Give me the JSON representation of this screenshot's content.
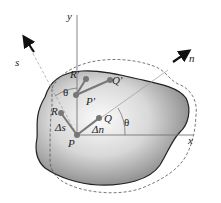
{
  "figure": {
    "type": "mechanics-deformation-diagram",
    "colors": {
      "body_fill_light": "#f2f2f2",
      "body_fill_dark": "#6e6e6e",
      "outline": "#222222",
      "dashed_outline": "#555555",
      "axis": "#777777",
      "points": "#777777"
    }
  },
  "axes": {
    "x_label": "x",
    "y_label": "y",
    "n_label": "n",
    "s_label": "s"
  },
  "points": {
    "P": "P",
    "Q": "Q",
    "R": "R",
    "P_prime": "P'",
    "Q_prime": "Q'",
    "R_prime": "R'"
  },
  "annotations": {
    "delta_s": "Δs",
    "delta_n": "Δn",
    "theta_right": "θ",
    "theta_left": "θ"
  }
}
